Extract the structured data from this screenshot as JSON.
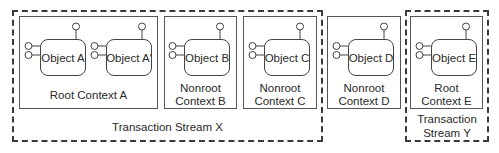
{
  "streams": [
    {
      "id": "X",
      "label": "Transaction Stream X"
    },
    {
      "id": "Y",
      "label_line1": "Transaction",
      "label_line2": "Stream Y"
    }
  ],
  "contexts": [
    {
      "id": "A",
      "line1": "Root Context A",
      "objects": [
        "Object A",
        "Object A'"
      ]
    },
    {
      "id": "B",
      "line1": "Nonroot",
      "line2": "Context B",
      "objects": [
        "Object B"
      ]
    },
    {
      "id": "C",
      "line1": "Nonroot",
      "line2": "Context C",
      "objects": [
        "Object C"
      ]
    },
    {
      "id": "D",
      "line1": "Nonroot",
      "line2": "Context D",
      "objects": [
        "Object D"
      ]
    },
    {
      "id": "E",
      "line1": "Root",
      "line2": "Context E",
      "objects": [
        "Object E"
      ]
    }
  ],
  "colors": {
    "stroke": "#3a3a3a",
    "background": "#ffffff"
  }
}
